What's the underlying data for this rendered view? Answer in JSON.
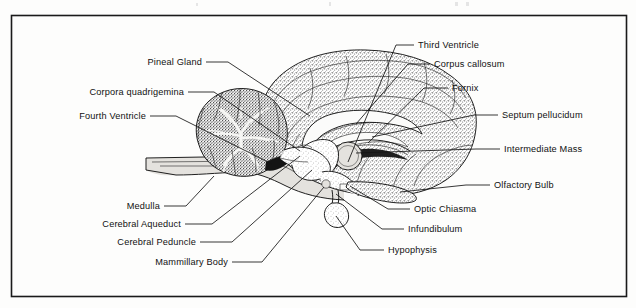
{
  "figure": {
    "frame": {
      "visible": true,
      "color": "#1a1a1a"
    },
    "background_color": "#fdfdfc",
    "ink_color": "#141414"
  },
  "labels_left": [
    {
      "id": "pineal-gland",
      "text": "Pineal Gland"
    },
    {
      "id": "corpora-quadrigemina",
      "text": "Corpora quadrigemina"
    },
    {
      "id": "fourth-ventricle",
      "text": "Fourth Ventricle"
    },
    {
      "id": "medulla",
      "text": "Medulla"
    },
    {
      "id": "cerebral-aqueduct",
      "text": "Cerebral Aqueduct"
    },
    {
      "id": "cerebral-peduncle",
      "text": "Cerebral Peduncle"
    },
    {
      "id": "mammillary-body",
      "text": "Mammillary Body"
    }
  ],
  "labels_right": [
    {
      "id": "third-ventricle",
      "text": "Third Ventricle"
    },
    {
      "id": "corpus-callosum",
      "text": "Corpus callosum"
    },
    {
      "id": "fornix",
      "text": "Fornix"
    },
    {
      "id": "septum-pellucidum",
      "text": "Septum pellucidum"
    },
    {
      "id": "intermediate-mass",
      "text": "Intermediate Mass"
    },
    {
      "id": "olfactory-bulb",
      "text": "Olfactory Bulb"
    },
    {
      "id": "optic-chiasma",
      "text": "Optic Chiasma"
    },
    {
      "id": "infundibulum",
      "text": "Infundibulum"
    },
    {
      "id": "hypophysis",
      "text": "Hypophysis"
    }
  ],
  "structures": [
    {
      "id": "cerebrum",
      "name": "Cerebrum"
    },
    {
      "id": "cerebellum",
      "name": "Cerebellum"
    },
    {
      "id": "brainstem",
      "name": "Brainstem and spinal cord"
    },
    {
      "id": "corpus-callosum-body",
      "name": "Corpus callosum"
    },
    {
      "id": "thalamus",
      "name": "Intermediate mass of thalamus"
    },
    {
      "id": "hypophysis-body",
      "name": "Hypophysis"
    },
    {
      "id": "olfactory-bulb-body",
      "name": "Olfactory bulb"
    }
  ]
}
